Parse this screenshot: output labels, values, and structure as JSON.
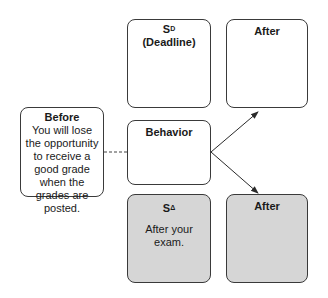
{
  "diagram": {
    "before": {
      "title": "Before",
      "text": "You will lose the opportunity to receive a good grade when the grades are posted."
    },
    "sd": {
      "symbol": "S",
      "superscript": "D",
      "label": "(Deadline)"
    },
    "after_top": {
      "title": "After"
    },
    "behavior": {
      "title": "Behavior"
    },
    "sdelta": {
      "symbol": "S",
      "superscript": "Δ",
      "text": "After your exam."
    },
    "after_bottom": {
      "title": "After"
    },
    "colors": {
      "border": "#3a3a3a",
      "shaded_fill": "#d6d6d6",
      "background": "#ffffff"
    }
  }
}
